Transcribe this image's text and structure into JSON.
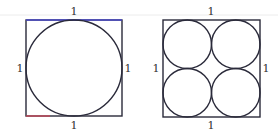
{
  "figures": [
    {
      "name": "one-circle-in-square",
      "square": {
        "x": 26,
        "y": 20,
        "size": 96
      },
      "labels": {
        "top": "1",
        "left": "1",
        "right": "1",
        "bottom": "1"
      },
      "circles": [
        {
          "cx": 74,
          "cy": 68,
          "r": 48
        }
      ]
    },
    {
      "name": "four-circles-in-square",
      "square": {
        "x": 163,
        "y": 20,
        "size": 97
      },
      "labels": {
        "top": "1",
        "left": "1",
        "right": "1",
        "bottom": "1"
      },
      "circles": [
        {
          "cx": 187.25,
          "cy": 44.25,
          "r": 24.25
        },
        {
          "cx": 235.75,
          "cy": 44.25,
          "r": 24.25
        },
        {
          "cx": 187.25,
          "cy": 92.75,
          "r": 24.25
        },
        {
          "cx": 235.75,
          "cy": 92.75,
          "r": 24.25
        }
      ]
    }
  ],
  "colors": {
    "stroke": "#2a2a3a",
    "top_edge": "#4a4ac8",
    "bottom_accent": "#c84a5a",
    "rule": "#e6e6e6"
  }
}
